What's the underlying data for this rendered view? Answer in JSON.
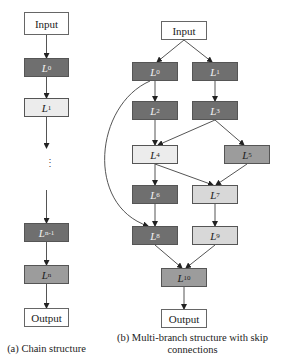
{
  "chain": {
    "input": "Input",
    "nodes": [
      {
        "base": "L",
        "sub": "0",
        "shade": "dark"
      },
      {
        "base": "L",
        "sub": "1",
        "shade": "light"
      },
      {
        "base": "L",
        "sub": "n-1",
        "shade": "dark"
      },
      {
        "base": "L",
        "sub": "n",
        "shade": "medium"
      }
    ],
    "ellipsis": "⋮",
    "output": "Output",
    "caption": "(a) Chain structure"
  },
  "multibranch": {
    "input": "Input",
    "nodes": [
      {
        "base": "L",
        "sub": "0",
        "shade": "dark"
      },
      {
        "base": "L",
        "sub": "1",
        "shade": "dark"
      },
      {
        "base": "L",
        "sub": "2",
        "shade": "dark"
      },
      {
        "base": "L",
        "sub": "3",
        "shade": "dark"
      },
      {
        "base": "L",
        "sub": "4",
        "shade": "light"
      },
      {
        "base": "L",
        "sub": "5",
        "shade": "medium"
      },
      {
        "base": "L",
        "sub": "6",
        "shade": "dark"
      },
      {
        "base": "L",
        "sub": "7",
        "shade": "pale"
      },
      {
        "base": "L",
        "sub": "8",
        "shade": "dark"
      },
      {
        "base": "L",
        "sub": "9",
        "shade": "pale"
      },
      {
        "base": "L",
        "sub": "10",
        "shade": "medium"
      }
    ],
    "edges": [
      [
        "Input",
        "L0"
      ],
      [
        "Input",
        "L1"
      ],
      [
        "L0",
        "L2"
      ],
      [
        "L1",
        "L3"
      ],
      [
        "L2",
        "L4"
      ],
      [
        "L3",
        "L4"
      ],
      [
        "L3",
        "L5"
      ],
      [
        "L4",
        "L6"
      ],
      [
        "L4",
        "L7"
      ],
      [
        "L5",
        "L7"
      ],
      [
        "L6",
        "L8"
      ],
      [
        "L0",
        "L8 (skip)"
      ],
      [
        "L7",
        "L9"
      ],
      [
        "L8",
        "L10"
      ],
      [
        "L9",
        "L10"
      ],
      [
        "L10",
        "Output"
      ]
    ],
    "output": "Output",
    "caption_line1": "(b) Multi-branch structure with skip",
    "caption_line2": "connections"
  },
  "colors": {
    "dark": "#6f6f6f",
    "medium": "#9c9c9c",
    "pale": "#d8d8d8",
    "light": "#ececec",
    "edge": "#555555"
  }
}
